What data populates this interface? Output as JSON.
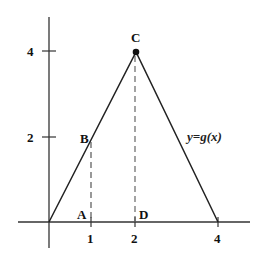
{
  "figure": {
    "function_label": "y=g(x)",
    "x_ticks": [
      {
        "value": 1,
        "label": "1"
      },
      {
        "value": 2,
        "label": "2"
      },
      {
        "value": 4,
        "label": "4"
      }
    ],
    "y_ticks": [
      {
        "value": 2,
        "label": "2"
      },
      {
        "value": 4,
        "label": "4"
      }
    ],
    "points": {
      "A": {
        "label": "A",
        "x": 1,
        "y": 0
      },
      "B": {
        "label": "B",
        "x": 1,
        "y": 2
      },
      "C": {
        "label": "C",
        "x": 2,
        "y": 4
      },
      "D": {
        "label": "D",
        "x": 2,
        "y": 0
      }
    },
    "graph_vertices": [
      [
        0,
        0
      ],
      [
        2,
        4
      ],
      [
        4,
        0
      ]
    ],
    "dashed_segments": [
      {
        "from": "A",
        "to": "B"
      },
      {
        "from": "D",
        "to": "C"
      }
    ],
    "colors": {
      "line": "#222222",
      "dashed": "#555555",
      "background": "#ffffff"
    }
  }
}
